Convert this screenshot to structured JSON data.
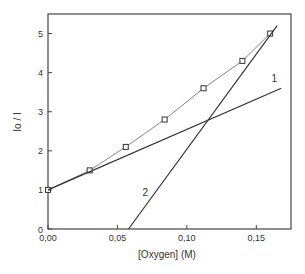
{
  "chart_data": {
    "type": "line",
    "title": "",
    "xlabel": "[Oxygen] (M)",
    "ylabel": "Io / I",
    "xlim": [
      0,
      0.175
    ],
    "ylim": [
      0,
      5.5
    ],
    "xticks": [
      0,
      0.05,
      0.1,
      0.15
    ],
    "xtick_labels": [
      "0,00",
      "0,05",
      "0,10",
      "0,15"
    ],
    "yticks": [
      0,
      1,
      2,
      3,
      4,
      5
    ],
    "ytick_labels": [
      "0",
      "1",
      "2",
      "3",
      "4",
      "5"
    ],
    "grid": false,
    "series": [
      {
        "name": "data",
        "marker": "open-square",
        "x": [
          0.0,
          0.03,
          0.056,
          0.084,
          0.112,
          0.14,
          0.16
        ],
        "y": [
          1.0,
          1.5,
          2.1,
          2.8,
          3.6,
          4.3,
          5.0
        ]
      },
      {
        "name": "1",
        "marker": "none",
        "x": [
          0.0,
          0.168
        ],
        "y": [
          1.0,
          3.6
        ]
      },
      {
        "name": "2",
        "marker": "none",
        "x": [
          0.058,
          0.165
        ],
        "y": [
          0.0,
          5.2
        ]
      }
    ],
    "annotations": [
      {
        "text": "1",
        "x": 0.163,
        "y": 3.75
      },
      {
        "text": "2",
        "x": 0.07,
        "y": 0.85
      }
    ]
  }
}
